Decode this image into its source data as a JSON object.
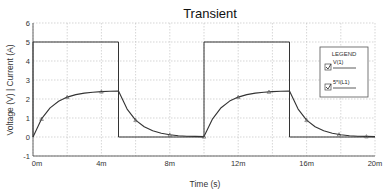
{
  "chart_data": {
    "type": "line",
    "title": "Transient",
    "xlabel": "Time (s)",
    "ylabel": "Voltage (V) | Current (A)",
    "xlim": [
      0,
      20
    ],
    "ylim": [
      -1,
      6
    ],
    "x_unit_suffix": "m",
    "x_ticks": [
      "0m",
      "4m",
      "8m",
      "12m",
      "16m",
      "20m"
    ],
    "x_tick_values": [
      0,
      4,
      8,
      12,
      16,
      20
    ],
    "y_ticks": [
      "6",
      "5",
      "4",
      "3",
      "2",
      "1",
      "0",
      "-1"
    ],
    "y_tick_values": [
      6,
      5,
      4,
      3,
      2,
      1,
      0,
      -1
    ],
    "grid": true,
    "grid_x_minor": [
      2,
      6,
      10,
      14,
      18
    ],
    "legend": {
      "title": "LEGEND",
      "position": "right",
      "entries": [
        "V(1)",
        "5*I(L1)"
      ]
    },
    "series": [
      {
        "name": "V(1)",
        "color": "#333333",
        "x": [
          0,
          0,
          5,
          5,
          10,
          10,
          15,
          15,
          20
        ],
        "y": [
          0,
          5,
          5,
          0,
          0,
          5,
          5,
          0,
          0
        ]
      },
      {
        "name": "5*I(L1)",
        "color": "#333333",
        "markers": true,
        "x": [
          0,
          0.5,
          1,
          1.5,
          2,
          2.5,
          3,
          3.5,
          4,
          4.5,
          5,
          5.5,
          6,
          6.5,
          7,
          7.5,
          8,
          8.5,
          9,
          9.5,
          10,
          10.5,
          11,
          11.5,
          12,
          12.5,
          13,
          13.5,
          14,
          14.5,
          15,
          15.5,
          16,
          16.5,
          17,
          17.5,
          18,
          18.5,
          19,
          19.5,
          20
        ],
        "y": [
          0,
          0.95,
          1.53,
          1.88,
          2.1,
          2.23,
          2.31,
          2.36,
          2.39,
          2.41,
          2.42,
          1.47,
          0.89,
          0.54,
          0.33,
          0.2,
          0.12,
          0.07,
          0.04,
          0.03,
          0.02,
          0.96,
          1.54,
          1.89,
          2.1,
          2.23,
          2.31,
          2.36,
          2.39,
          2.41,
          2.42,
          1.47,
          0.89,
          0.54,
          0.33,
          0.2,
          0.12,
          0.07,
          0.04,
          0.03,
          0.02
        ],
        "marker_x": [
          0.5,
          2,
          4,
          6,
          8,
          10,
          12,
          13.8,
          16,
          17.9,
          19.5
        ]
      }
    ]
  }
}
